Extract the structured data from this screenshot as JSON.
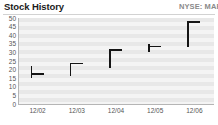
{
  "header": {
    "title": "Stock History",
    "ticker": "NYSE: MAR"
  },
  "chart_data": {
    "type": "bar",
    "title": "Stock History",
    "subtitle": "NYSE: MAR",
    "xlabel": "",
    "ylabel": "",
    "categories": [
      "12/02",
      "12/03",
      "12/04",
      "12/05",
      "12/06"
    ],
    "ylim": [
      0,
      50
    ],
    "yticks": [
      50,
      45,
      40,
      35,
      30,
      25,
      20,
      15,
      10,
      5,
      0
    ],
    "grid": true,
    "legend": false,
    "series": [
      {
        "name": "Range Low",
        "values": [
          15,
          16,
          21,
          30,
          33
        ]
      },
      {
        "name": "Range High",
        "values": [
          22,
          24,
          32,
          35,
          48
        ]
      },
      {
        "name": "Close",
        "values": [
          18,
          24,
          32,
          34,
          48
        ]
      }
    ],
    "bars": [
      {
        "label": "12/02",
        "low": 15,
        "high": 22,
        "close": 18
      },
      {
        "label": "12/03",
        "low": 16,
        "high": 24,
        "close": 24
      },
      {
        "label": "12/04",
        "low": 21,
        "high": 32,
        "close": 32
      },
      {
        "label": "12/05",
        "low": 30,
        "high": 35,
        "close": 34
      },
      {
        "label": "12/06",
        "low": 33,
        "high": 48,
        "close": 48
      }
    ]
  },
  "colors": {
    "marker": "#151515",
    "grid_dark": "#e8e8e8",
    "grid_light": "#f4f4f4",
    "axis": "#b5b5b5",
    "title": "#1b1b1b",
    "ticker": "#8a8a8a",
    "tick_label": "#555555"
  }
}
